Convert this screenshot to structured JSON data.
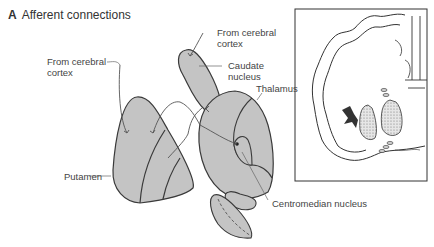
{
  "figure": {
    "panel_letter": "A",
    "title": "Afferent connections"
  },
  "labels": {
    "cortex_left_line1": "From cerebral",
    "cortex_left_line2": "cortex",
    "cortex_top_line1": "From cerebral",
    "cortex_top_line2": "cortex",
    "caudate_line1": "Caudate",
    "caudate_line2": "nucleus",
    "thalamus": "Thalamus",
    "putamen": "Putamen",
    "centromedian": "Centromedian nucleus"
  },
  "colors": {
    "structure_fill": "#c4c4c4",
    "outline": "#3a3a3a",
    "leader_line": "#666666",
    "stipple": "#9a9a9a"
  }
}
